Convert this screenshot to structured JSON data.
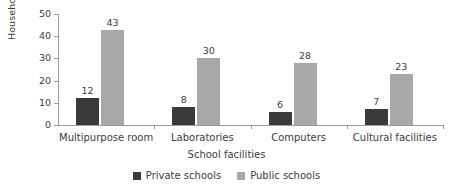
{
  "chart_data": {
    "type": "bar",
    "title": "",
    "xlabel": "School facilities",
    "ylabel": "Households (%)",
    "categories": [
      "Multipurpose room",
      "Laboratories",
      "Computers",
      "Cultural facilities"
    ],
    "series": [
      {
        "name": "Private schools",
        "color": "#3a3a3a",
        "values": [
          12,
          8,
          6,
          7
        ]
      },
      {
        "name": "Public schools",
        "color": "#a8a8a8",
        "values": [
          43,
          30,
          28,
          23
        ]
      }
    ],
    "ylim": [
      0,
      50
    ],
    "yticks": [
      0,
      10,
      20,
      30,
      40,
      50
    ],
    "ytick_labels": [
      "0",
      "10",
      "20",
      "30",
      "40",
      "50"
    ],
    "grid": false,
    "legend_position": "bottom",
    "data_labels": true,
    "axis_color": "#9a9a9a",
    "text_color": "#3d3d3d",
    "background": "#ffffff"
  }
}
